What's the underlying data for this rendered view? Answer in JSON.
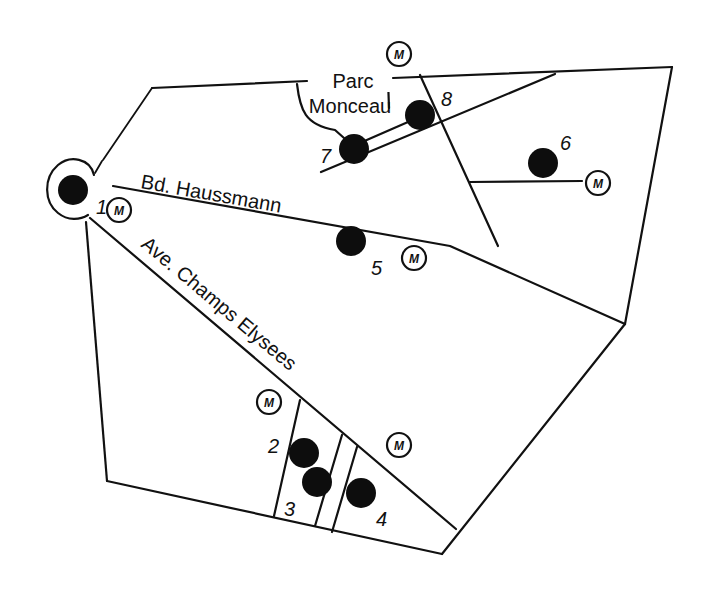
{
  "map": {
    "background": "#ffffff",
    "ink": "#111111",
    "labels": {
      "parc_line1": "Parc",
      "parc_line2": "Monceau",
      "bd_haussmann": "Bd. Haussmann",
      "champs_elysees": "Ave. Champs Elysees"
    },
    "metro_symbol": "M",
    "sites": [
      {
        "id": "1",
        "label": "1",
        "x": 73,
        "y": 190,
        "r": 15,
        "lx": 96,
        "ly": 214
      },
      {
        "id": "2",
        "label": "2",
        "x": 304,
        "y": 453,
        "r": 15,
        "lx": 268,
        "ly": 453
      },
      {
        "id": "3",
        "label": "3",
        "x": 317,
        "y": 482,
        "r": 15,
        "lx": 284,
        "ly": 516
      },
      {
        "id": "4",
        "label": "4",
        "x": 361,
        "y": 493,
        "r": 15,
        "lx": 376,
        "ly": 526
      },
      {
        "id": "5",
        "label": "5",
        "x": 351,
        "y": 241,
        "r": 15,
        "lx": 371,
        "ly": 275
      },
      {
        "id": "6",
        "label": "6",
        "x": 543,
        "y": 163,
        "r": 15,
        "lx": 560,
        "ly": 150
      },
      {
        "id": "7",
        "label": "7",
        "x": 354,
        "y": 149,
        "r": 15,
        "lx": 320,
        "ly": 163
      },
      {
        "id": "8",
        "label": "8",
        "x": 420,
        "y": 115,
        "r": 15,
        "lx": 441,
        "ly": 106
      }
    ],
    "metro_stations": [
      {
        "x": 399,
        "y": 54
      },
      {
        "x": 119,
        "y": 210
      },
      {
        "x": 598,
        "y": 183
      },
      {
        "x": 414,
        "y": 258
      },
      {
        "x": 269,
        "y": 402
      },
      {
        "x": 399,
        "y": 445
      }
    ]
  }
}
